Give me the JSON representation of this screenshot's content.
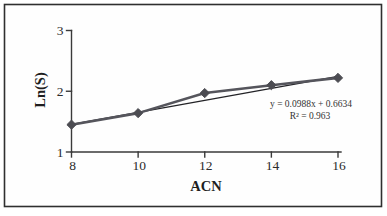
{
  "figure": {
    "background": "#ffffff",
    "border_color": "#2f2f2f"
  },
  "chart_data": {
    "type": "line",
    "title": "",
    "xlabel": "ACN",
    "ylabel": "Ln(S)",
    "x": [
      8,
      10,
      12,
      14,
      16
    ],
    "series": [
      {
        "name": "Ln(S) vs ACN",
        "values": [
          1.45,
          1.64,
          1.97,
          2.1,
          2.22
        ],
        "color": "#55555c",
        "marker": "diamond",
        "marker_color": "#4c4c52"
      }
    ],
    "trendline": {
      "type": "linear",
      "slope": 0.0988,
      "intercept": 0.6634,
      "r_squared": 0.963,
      "label": "y = 0.0988x + 0.6634",
      "r2_label": "R² = 0.963",
      "color": "#232327"
    },
    "xlim": [
      8,
      16
    ],
    "ylim": [
      1,
      3
    ],
    "xticks": [
      8,
      10,
      12,
      14,
      16
    ],
    "yticks": [
      1,
      2,
      3
    ],
    "grid": false,
    "legend": "none"
  }
}
